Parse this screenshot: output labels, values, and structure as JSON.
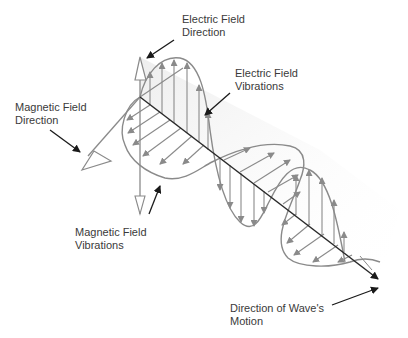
{
  "diagram": {
    "colors": {
      "background": "#ffffff",
      "wave_stroke": "#8a8a8a",
      "axis_stroke": "#2a2a2a",
      "pointer_stroke": "#1a1a1a",
      "label_text": "#3a3a3a",
      "plane_fill": "#f2f2f2"
    },
    "labels": {
      "electric_direction": {
        "line1": "Electric Field",
        "line2": "Direction"
      },
      "electric_vibrations": {
        "line1": "Electric Field",
        "line2": "Vibrations"
      },
      "magnetic_direction": {
        "line1": "Magnetic Field",
        "line2": "Direction"
      },
      "magnetic_vibrations": {
        "line1": "Magnetic Field",
        "line2": "Vibrations"
      },
      "wave_motion": {
        "line1": "Direction of Wave's",
        "line2": "Motion"
      }
    },
    "components": [
      "electric-field-direction-axis",
      "magnetic-field-direction-axis",
      "propagation-axis",
      "electric-field-wave",
      "magnetic-field-wave"
    ]
  }
}
